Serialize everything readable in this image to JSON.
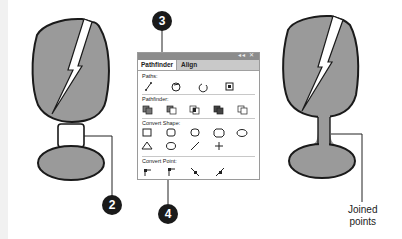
{
  "panel": {
    "title_controls": "◂◂ ✕",
    "tabs": [
      {
        "label": "Pathfinder",
        "active": true
      },
      {
        "label": "Align",
        "active": false
      }
    ],
    "sections": [
      {
        "label": "Paths:",
        "icons": [
          "join-path-icon",
          "outline-stroke-icon",
          "reverse-path-icon",
          "offset-path-icon"
        ]
      },
      {
        "label": "Pathfinder:",
        "icons": [
          "unite-icon",
          "minus-front-icon",
          "intersect-icon",
          "exclude-icon",
          "minus-back-icon"
        ]
      },
      {
        "label": "Convert Shape:",
        "icons": [
          "rectangle-icon",
          "rounded-rectangle-icon",
          "beveled-rectangle-icon",
          "inverse-rounded-rectangle-icon",
          "ellipse-icon",
          "triangle-icon",
          "polygon-icon",
          "line-icon",
          "orthogonal-line-icon"
        ]
      },
      {
        "label": "Convert Point:",
        "icons": [
          "plain-point-icon",
          "corner-point-icon",
          "smooth-point-icon",
          "symmetrical-point-icon"
        ]
      }
    ]
  },
  "callouts": {
    "c2": "2",
    "c3": "3",
    "c4": "4"
  },
  "annotation": {
    "line1": "Joined",
    "line2": "points"
  },
  "colors": {
    "shape_fill": "#9a9a9a",
    "outline": "#1a1a1a",
    "callout_bg": "#1a1a1a",
    "titlebar": "#8c8c8c"
  }
}
